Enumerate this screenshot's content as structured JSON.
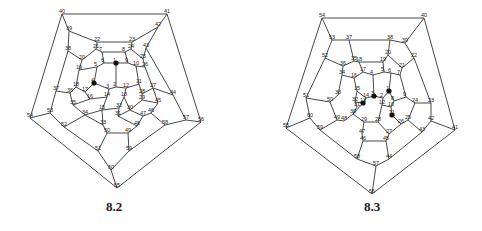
{
  "figures": [
    {
      "id": "8.2",
      "caption": "8.2",
      "highlighted_vertices": [
        1,
        4
      ],
      "vertices": {
        "40": [
          62,
          14
        ],
        "41": [
          167,
          14
        ],
        "56": [
          201,
          122
        ],
        "55": [
          117,
          188
        ],
        "54": [
          30,
          118
        ],
        "39": [
          69,
          31
        ],
        "42": [
          158,
          27
        ],
        "38": [
          68,
          51
        ],
        "43": [
          146,
          48
        ],
        "37": [
          56,
          91
        ],
        "44": [
          173,
          95
        ],
        "53": [
          50,
          113
        ],
        "57": [
          186,
          120
        ],
        "52": [
          64,
          127
        ],
        "58": [
          165,
          125
        ],
        "51": [
          98,
          151
        ],
        "59": [
          129,
          151
        ],
        "60": [
          111,
          170
        ],
        "22": [
          97,
          42
        ],
        "23": [
          132,
          42
        ],
        "21": [
          96,
          49
        ],
        "7": [
          102,
          52
        ],
        "8": [
          125,
          52
        ],
        "24": [
          131,
          49
        ],
        "20": [
          82,
          60
        ],
        "25": [
          143,
          59
        ],
        "19": [
          79,
          70
        ],
        "26": [
          145,
          67
        ],
        "6": [
          104,
          63
        ],
        "5": [
          97,
          67
        ],
        "1": [
          116,
          63
        ],
        "9": [
          128,
          63
        ],
        "10": [
          136,
          66
        ],
        "4": [
          94,
          83
        ],
        "3": [
          109,
          89
        ],
        "2": [
          116,
          87
        ],
        "12": [
          126,
          88
        ],
        "11": [
          139,
          84
        ],
        "18": [
          76,
          87
        ],
        "36": [
          70,
          93
        ],
        "17": [
          85,
          92
        ],
        "16": [
          90,
          99
        ],
        "14": [
          107,
          97
        ],
        "13": [
          124,
          97
        ],
        "28": [
          142,
          94
        ],
        "27": [
          153,
          88
        ],
        "29": [
          142,
          100
        ],
        "45": [
          158,
          103
        ],
        "35": [
          73,
          105
        ],
        "34": [
          85,
          115
        ],
        "15": [
          102,
          110
        ],
        "32": [
          119,
          108
        ],
        "30": [
          130,
          110
        ],
        "31": [
          118,
          116
        ],
        "47": [
          143,
          116
        ],
        "46": [
          151,
          113
        ],
        "33": [
          103,
          125
        ],
        "48": [
          137,
          126
        ],
        "50": [
          107,
          133
        ],
        "49": [
          128,
          133
        ]
      },
      "edges": [
        [
          40,
          41
        ],
        [
          41,
          56
        ],
        [
          56,
          55
        ],
        [
          55,
          54
        ],
        [
          54,
          40
        ],
        [
          40,
          39
        ],
        [
          41,
          42
        ],
        [
          54,
          53
        ],
        [
          56,
          57
        ],
        [
          55,
          60
        ],
        [
          39,
          38
        ],
        [
          39,
          22
        ],
        [
          42,
          43
        ],
        [
          42,
          23
        ],
        [
          38,
          37
        ],
        [
          38,
          20
        ],
        [
          43,
          44
        ],
        [
          43,
          25
        ],
        [
          37,
          53
        ],
        [
          37,
          36
        ],
        [
          44,
          57
        ],
        [
          44,
          27
        ],
        [
          53,
          52
        ],
        [
          57,
          58
        ],
        [
          52,
          51
        ],
        [
          52,
          34
        ],
        [
          58,
          59
        ],
        [
          58,
          46
        ],
        [
          51,
          60
        ],
        [
          51,
          50
        ],
        [
          59,
          60
        ],
        [
          59,
          49
        ],
        [
          22,
          23
        ],
        [
          22,
          21
        ],
        [
          23,
          24
        ],
        [
          21,
          7
        ],
        [
          24,
          8
        ],
        [
          7,
          8
        ],
        [
          21,
          20
        ],
        [
          24,
          25
        ],
        [
          20,
          19
        ],
        [
          25,
          26
        ],
        [
          7,
          6
        ],
        [
          8,
          9
        ],
        [
          6,
          5
        ],
        [
          6,
          1
        ],
        [
          9,
          1
        ],
        [
          9,
          10
        ],
        [
          5,
          19
        ],
        [
          10,
          26
        ],
        [
          5,
          4
        ],
        [
          10,
          11
        ],
        [
          1,
          2
        ],
        [
          19,
          18
        ],
        [
          26,
          27
        ],
        [
          18,
          36
        ],
        [
          18,
          17
        ],
        [
          27,
          28
        ],
        [
          36,
          35
        ],
        [
          35,
          34
        ],
        [
          17,
          16
        ],
        [
          4,
          17
        ],
        [
          4,
          3
        ],
        [
          11,
          12
        ],
        [
          11,
          28
        ],
        [
          3,
          2
        ],
        [
          2,
          12
        ],
        [
          3,
          14
        ],
        [
          12,
          13
        ],
        [
          16,
          14
        ],
        [
          16,
          35
        ],
        [
          14,
          15
        ],
        [
          13,
          32
        ],
        [
          13,
          30
        ],
        [
          28,
          29
        ],
        [
          29,
          30
        ],
        [
          29,
          45
        ],
        [
          45,
          27
        ],
        [
          45,
          46
        ],
        [
          46,
          47
        ],
        [
          47,
          30
        ],
        [
          47,
          48
        ],
        [
          15,
          32
        ],
        [
          15,
          34
        ],
        [
          15,
          33
        ],
        [
          32,
          31
        ],
        [
          31,
          30
        ],
        [
          31,
          48
        ],
        [
          33,
          34
        ],
        [
          33,
          50
        ],
        [
          50,
          49
        ],
        [
          49,
          48
        ]
      ]
    },
    {
      "id": "8.3",
      "caption": "8.3",
      "highlighted_vertices": [
        3,
        1,
        13,
        11
      ],
      "vertices": {
        "54": [
          322,
          18
        ],
        "40": [
          424,
          18
        ],
        "41": [
          455,
          130
        ],
        "56": [
          372,
          194
        ],
        "55": [
          286,
          128
        ],
        "53": [
          332,
          40
        ],
        "37": [
          349,
          40
        ],
        "38": [
          390,
          40
        ],
        "39": [
          405,
          43
        ],
        "52": [
          325,
          58
        ],
        "22": [
          414,
          58
        ],
        "36": [
          343,
          66
        ],
        "35": [
          354,
          61
        ],
        "18": [
          359,
          62
        ],
        "19": [
          383,
          62
        ],
        "20": [
          388,
          55
        ],
        "21": [
          402,
          68
        ],
        "7": [
          400,
          75
        ],
        "34": [
          342,
          75
        ],
        "16": [
          354,
          78
        ],
        "17": [
          363,
          72
        ],
        "4": [
          373,
          75
        ],
        "5": [
          384,
          72
        ],
        "6": [
          391,
          73
        ],
        "15": [
          357,
          91
        ],
        "33": [
          338,
          95
        ],
        "14": [
          366,
          98
        ],
        "3": [
          374,
          96
        ],
        "2": [
          383,
          98
        ],
        "1": [
          389,
          91
        ],
        "8": [
          394,
          101
        ],
        "9": [
          406,
          97
        ],
        "32": [
          355,
          102
        ],
        "13": [
          363,
          103
        ],
        "12": [
          382,
          105
        ],
        "10": [
          391,
          107
        ],
        "24": [
          415,
          103
        ],
        "50": [
          330,
          102
        ],
        "51": [
          306,
          98
        ],
        "23": [
          431,
          103
        ],
        "31": [
          357,
          107
        ],
        "30": [
          353,
          114
        ],
        "11": [
          392,
          115
        ],
        "49": [
          337,
          120
        ],
        "48": [
          344,
          121
        ],
        "29": [
          364,
          122
        ],
        "28": [
          378,
          122
        ],
        "26": [
          401,
          124
        ],
        "25": [
          408,
          120
        ],
        "60": [
          310,
          118
        ],
        "59": [
          320,
          130
        ],
        "42": [
          431,
          121
        ],
        "43": [
          422,
          132
        ],
        "47": [
          362,
          134
        ],
        "27": [
          389,
          134
        ],
        "46": [
          363,
          141
        ],
        "45": [
          386,
          141
        ],
        "58": [
          357,
          159
        ],
        "44": [
          389,
          159
        ],
        "57": [
          376,
          166
        ]
      },
      "edges": [
        [
          54,
          40
        ],
        [
          40,
          41
        ],
        [
          41,
          56
        ],
        [
          56,
          55
        ],
        [
          55,
          54
        ],
        [
          54,
          53
        ],
        [
          40,
          39
        ],
        [
          41,
          42
        ],
        [
          56,
          57
        ],
        [
          55,
          60
        ],
        [
          53,
          37
        ],
        [
          53,
          52
        ],
        [
          37,
          38
        ],
        [
          38,
          39
        ],
        [
          39,
          22
        ],
        [
          37,
          35
        ],
        [
          38,
          20
        ],
        [
          52,
          51
        ],
        [
          52,
          36
        ],
        [
          22,
          23
        ],
        [
          22,
          21
        ],
        [
          36,
          35
        ],
        [
          35,
          18
        ],
        [
          18,
          19
        ],
        [
          19,
          20
        ],
        [
          20,
          21
        ],
        [
          21,
          7
        ],
        [
          36,
          34
        ],
        [
          18,
          17
        ],
        [
          19,
          5
        ],
        [
          17,
          4
        ],
        [
          4,
          5
        ],
        [
          5,
          6
        ],
        [
          6,
          7
        ],
        [
          17,
          16
        ],
        [
          16,
          34
        ],
        [
          16,
          15
        ],
        [
          4,
          3
        ],
        [
          6,
          1
        ],
        [
          1,
          2
        ],
        [
          2,
          3
        ],
        [
          3,
          14
        ],
        [
          14,
          15
        ],
        [
          14,
          13
        ],
        [
          13,
          32
        ],
        [
          32,
          15
        ],
        [
          32,
          31
        ],
        [
          31,
          30
        ],
        [
          30,
          13
        ],
        [
          1,
          8
        ],
        [
          8,
          9
        ],
        [
          9,
          7
        ],
        [
          9,
          24
        ],
        [
          8,
          10
        ],
        [
          10,
          12
        ],
        [
          12,
          2
        ],
        [
          12,
          28
        ],
        [
          10,
          11
        ],
        [
          11,
          26
        ],
        [
          26,
          25
        ],
        [
          25,
          24
        ],
        [
          24,
          23
        ],
        [
          23,
          42
        ],
        [
          42,
          43
        ],
        [
          43,
          25
        ],
        [
          43,
          44
        ],
        [
          34,
          33
        ],
        [
          33,
          50
        ],
        [
          50,
          51
        ],
        [
          51,
          60
        ],
        [
          60,
          59
        ],
        [
          59,
          58
        ],
        [
          50,
          49
        ],
        [
          49,
          48
        ],
        [
          48,
          30
        ],
        [
          49,
          59
        ],
        [
          30,
          29
        ],
        [
          29,
          28
        ],
        [
          28,
          27
        ],
        [
          29,
          47
        ],
        [
          47,
          46
        ],
        [
          46,
          45
        ],
        [
          45,
          27
        ],
        [
          27,
          26
        ],
        [
          46,
          58
        ],
        [
          45,
          44
        ],
        [
          58,
          57
        ],
        [
          57,
          44
        ]
      ]
    }
  ]
}
